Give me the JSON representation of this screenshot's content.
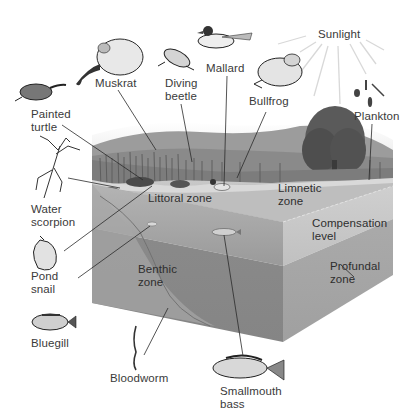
{
  "diagram": {
    "colors": {
      "background": "#ffffff",
      "text": "#3a3a3a",
      "leader_line": "#2a2a2a",
      "sun_ray": "#d6d6d6",
      "water_top": "#bdbdbd",
      "front_upper": "#a9a9a9",
      "front_lower": "#8e8e8e",
      "side_upper": "#c4c4c4",
      "side_lower": "#a3a3a3",
      "vegetation": "#6e6e6e",
      "tree": "#555555",
      "hills": "#9c9c9c"
    },
    "zones": {
      "littoral": "Littoral zone",
      "limnetic": [
        "Limnetic",
        "zone"
      ],
      "compensation": [
        "Compensation",
        "level"
      ],
      "profundal": [
        "Profundal",
        "zone"
      ],
      "benthic": [
        "Benthic",
        "zone"
      ]
    },
    "organisms": {
      "muskrat": [
        "Muskrat"
      ],
      "diving_beetle": [
        "Diving",
        "beetle"
      ],
      "mallard": [
        "Mallard"
      ],
      "bullfrog": [
        "Bullfrog"
      ],
      "painted_turtle": [
        "Painted",
        "turtle"
      ],
      "water_scorpion": [
        "Water",
        "scorpion"
      ],
      "pond_snail": [
        "Pond",
        "snail"
      ],
      "bluegill": [
        "Bluegill"
      ],
      "bloodworm": [
        "Bloodworm"
      ],
      "smallmouth_bass": [
        "Smallmouth",
        "bass"
      ],
      "plankton": [
        "Plankton"
      ]
    },
    "sunlight": "Sunlight"
  }
}
